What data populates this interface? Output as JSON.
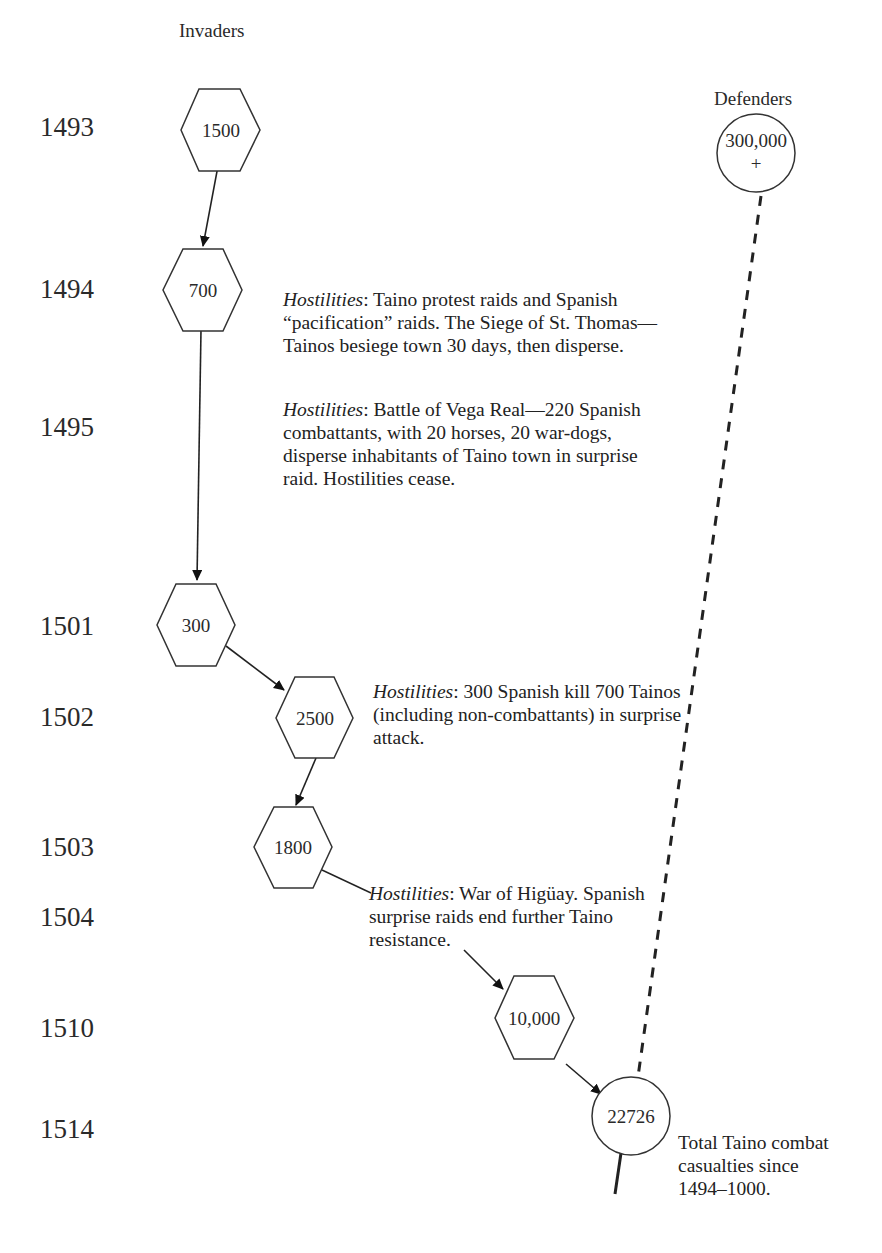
{
  "headers": {
    "invaders": "Invaders",
    "defenders": "Defenders"
  },
  "years": [
    "1493",
    "1494",
    "1495",
    "1501",
    "1502",
    "1503",
    "1504",
    "1510",
    "1514"
  ],
  "invader_nodes": [
    {
      "year": "1493",
      "value": "1500",
      "shape": "hexagon"
    },
    {
      "year": "1494",
      "value": "700",
      "shape": "hexagon"
    },
    {
      "year": "1501",
      "value": "300",
      "shape": "hexagon"
    },
    {
      "year": "1502",
      "value": "2500",
      "shape": "hexagon"
    },
    {
      "year": "1503",
      "value": "1800",
      "shape": "hexagon"
    },
    {
      "year": "1510",
      "value": "10,000",
      "shape": "hexagon"
    }
  ],
  "defender_nodes": [
    {
      "year": "1493",
      "value_line1": "300,000",
      "value_line2": "+",
      "shape": "circle"
    },
    {
      "year": "1514",
      "value": "22726",
      "shape": "circle"
    }
  ],
  "notes": [
    {
      "label": "Hostilities",
      "text": ": Taino protest raids and Spanish “pacification” raids. The Siege of St. Thomas—Tainos besiege town 30 days, then disperse."
    },
    {
      "label": "Hostilities",
      "text": ": Battle of Vega Real—220 Spanish combattants, with 20 horses, 20 war-dogs, disperse inhabitants of Taino town in surprise raid. Hostilities cease."
    },
    {
      "label": "Hostilities",
      "text": ": 300 Spanish kill 700 Tainos (including non-combattants) in surprise attack."
    },
    {
      "label": "Hostilities",
      "text": ": War of Higüay. Spanish surprise raids end further Taino resistance."
    }
  ],
  "footnote": "Total Taino combat casualties since 1494–1000.",
  "colors": {
    "line": "#222222",
    "text": "#2a2a2a",
    "background": "#ffffff"
  }
}
